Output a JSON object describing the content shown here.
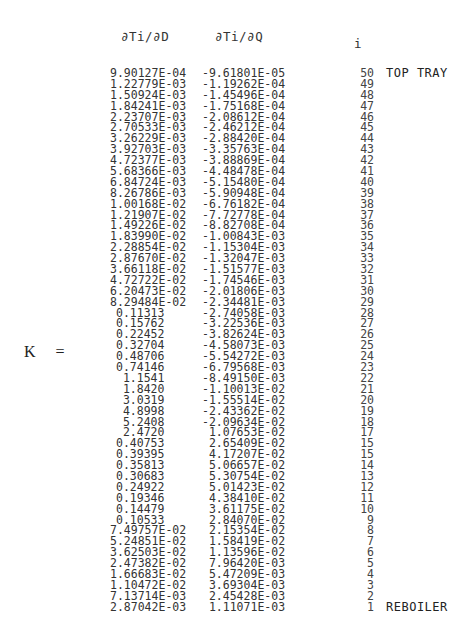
{
  "headers": {
    "d_derivative": "∂Ti/∂D",
    "q_derivative": "∂Ti/∂Q",
    "index": "i"
  },
  "matrix_label": {
    "symbol": "K",
    "equals": "="
  },
  "rows": [
    {
      "d": "9.90127E-04",
      "q": "-9.61801E-05",
      "i": "50",
      "note": "TOP TRAY"
    },
    {
      "d": "1.22779E-03",
      "q": "-1.19262E-04",
      "i": "49",
      "note": ""
    },
    {
      "d": "1.50924E-03",
      "q": "-1.45496E-04",
      "i": "48",
      "note": ""
    },
    {
      "d": "1.84241E-03",
      "q": "-1.75168E-04",
      "i": "47",
      "note": ""
    },
    {
      "d": "2.23707E-03",
      "q": "-2.08612E-04",
      "i": "46",
      "note": ""
    },
    {
      "d": "2.70533E-03",
      "q": "-2.46212E-04",
      "i": "45",
      "note": ""
    },
    {
      "d": "3.26229E-03",
      "q": "-2.88420E-04",
      "i": "44",
      "note": ""
    },
    {
      "d": "3.92703E-03",
      "q": "-3.35763E-04",
      "i": "43",
      "note": ""
    },
    {
      "d": "4.72377E-03",
      "q": "-3.88869E-04",
      "i": "42",
      "note": ""
    },
    {
      "d": "5.68366E-03",
      "q": "-4.48478E-04",
      "i": "41",
      "note": ""
    },
    {
      "d": "6.84724E-03",
      "q": "-5.15480E-04",
      "i": "40",
      "note": ""
    },
    {
      "d": "8.26786E-03",
      "q": "-5.90948E-04",
      "i": "39",
      "note": ""
    },
    {
      "d": "1.00168E-02",
      "q": "-6.76182E-04",
      "i": "38",
      "note": ""
    },
    {
      "d": "1.21907E-02",
      "q": "-7.72778E-04",
      "i": "37",
      "note": ""
    },
    {
      "d": "1.49226E-02",
      "q": "-8.82708E-04",
      "i": "36",
      "note": ""
    },
    {
      "d": "1.83990E-02",
      "q": "-1.00843E-03",
      "i": "35",
      "note": ""
    },
    {
      "d": "2.28854E-02",
      "q": "-1.15304E-03",
      "i": "34",
      "note": ""
    },
    {
      "d": "2.87670E-02",
      "q": "-1.32047E-03",
      "i": "33",
      "note": ""
    },
    {
      "d": "3.66118E-02",
      "q": "-1.51577E-03",
      "i": "32",
      "note": ""
    },
    {
      "d": "4.72722E-02",
      "q": "-1.74546E-03",
      "i": "31",
      "note": ""
    },
    {
      "d": "6.20473E-02",
      "q": "-2.01806E-03",
      "i": "30",
      "note": ""
    },
    {
      "d": "8.29484E-02",
      "q": "-2.34481E-03",
      "i": "29",
      "note": ""
    },
    {
      "d": "0.11313",
      "q": "-2.74058E-03",
      "i": "28",
      "note": ""
    },
    {
      "d": "0.15762",
      "q": "-3.22536E-03",
      "i": "27",
      "note": ""
    },
    {
      "d": "0.22452",
      "q": "-3.82624E-03",
      "i": "26",
      "note": ""
    },
    {
      "d": "0.32704",
      "q": "-4.58073E-03",
      "i": "25",
      "note": ""
    },
    {
      "d": "0.48706",
      "q": "-5.54272E-03",
      "i": "24",
      "note": ""
    },
    {
      "d": "0.74146",
      "q": "-6.79568E-03",
      "i": "23",
      "note": ""
    },
    {
      "d": " 1.1541",
      "q": "-8.49150E-03",
      "i": "22",
      "note": ""
    },
    {
      "d": " 1.8420",
      "q": "-1.10013E-02",
      "i": "21",
      "note": ""
    },
    {
      "d": " 3.0319",
      "q": "-1.55514E-02",
      "i": "20",
      "note": ""
    },
    {
      "d": " 4.8998",
      "q": "-2.43362E-02",
      "i": "19",
      "note": ""
    },
    {
      "d": " 5.2408",
      "q": "-2.09634E-02",
      "i": "18",
      "note": ""
    },
    {
      "d": " 2.4720",
      "q": " 1.07653E-02",
      "i": "17",
      "note": ""
    },
    {
      "d": "0.40753",
      "q": " 2.65409E-02",
      "i": "15",
      "note": ""
    },
    {
      "d": "0.39395",
      "q": " 4.17207E-02",
      "i": "15",
      "note": ""
    },
    {
      "d": "0.35813",
      "q": " 5.06657E-02",
      "i": "14",
      "note": ""
    },
    {
      "d": "0.30683",
      "q": " 5.30754E-02",
      "i": "13",
      "note": ""
    },
    {
      "d": "0.24922",
      "q": " 5.01423E-02",
      "i": "12",
      "note": ""
    },
    {
      "d": "0.19346",
      "q": " 4.38410E-02",
      "i": "11",
      "note": ""
    },
    {
      "d": "0.14479",
      "q": " 3.61175E-02",
      "i": "10",
      "note": ""
    },
    {
      "d": "0.10533",
      "q": " 2.84070E-02",
      "i": "9",
      "note": ""
    },
    {
      "d": "7.49757E-02",
      "q": " 2.15354E-02",
      "i": "8",
      "note": ""
    },
    {
      "d": "5.24851E-02",
      "q": " 1.58419E-02",
      "i": "7",
      "note": ""
    },
    {
      "d": "3.62503E-02",
      "q": " 1.13596E-02",
      "i": "6",
      "note": ""
    },
    {
      "d": "2.47382E-02",
      "q": " 7.96420E-03",
      "i": "5",
      "note": ""
    },
    {
      "d": "1.66683E-02",
      "q": " 5.47209E-03",
      "i": "4",
      "note": ""
    },
    {
      "d": "1.10472E-02",
      "q": " 3.69304E-03",
      "i": "3",
      "note": ""
    },
    {
      "d": "7.13714E-03",
      "q": " 2.45428E-03",
      "i": "2",
      "note": ""
    },
    {
      "d": "2.87042E-03",
      "q": " 1.11071E-03",
      "i": "1",
      "note": "REBOILER"
    }
  ]
}
